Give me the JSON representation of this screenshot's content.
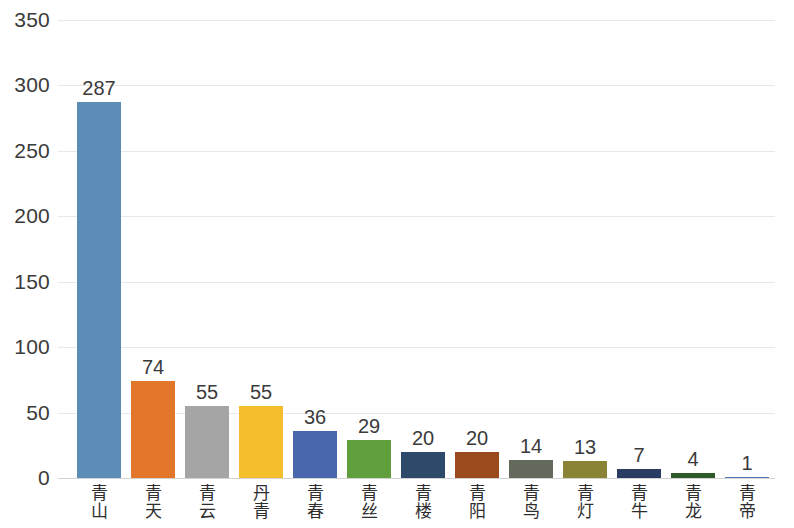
{
  "chart_data": {
    "type": "bar",
    "title": "",
    "subtitle": "",
    "xlabel": "",
    "ylabel": "",
    "ylim": [
      0,
      350
    ],
    "yticks": [
      0,
      50,
      100,
      150,
      200,
      250,
      300,
      350
    ],
    "ytick_labels": [
      "0",
      "50",
      "100",
      "150",
      "200",
      "250",
      "300",
      "350"
    ],
    "grid": true,
    "legend": false,
    "legend_position": "none",
    "orientation": "vertical",
    "data_labels": true,
    "categories": [
      "青山",
      "青天",
      "青云",
      "丹青",
      "青春",
      "青丝",
      "青楼",
      "青阳",
      "青鸟",
      "青灯",
      "青牛",
      "青龙",
      "青帝"
    ],
    "values": [
      287,
      74,
      55,
      55,
      36,
      29,
      20,
      20,
      14,
      13,
      7,
      4,
      1
    ],
    "value_labels": [
      "287",
      "74",
      "55",
      "55",
      "36",
      "29",
      "20",
      "20",
      "14",
      "13",
      "7",
      "4",
      "1"
    ],
    "colors": [
      "#5B8DB8",
      "#E2762B",
      "#A5A5A5",
      "#F4BE2D",
      "#4A67AE",
      "#5FA03C",
      "#2E4A6B",
      "#9B4A1D",
      "#636A5C",
      "#8A8235",
      "#2A3C62",
      "#2D5A28",
      "#4F7CB0"
    ],
    "bar_labels_chars": [
      [
        "青",
        "山"
      ],
      [
        "青",
        "天"
      ],
      [
        "青",
        "云"
      ],
      [
        "丹",
        "青"
      ],
      [
        "青",
        "春"
      ],
      [
        "青",
        "丝"
      ],
      [
        "青",
        "楼"
      ],
      [
        "青",
        "阳"
      ],
      [
        "青",
        "鸟"
      ],
      [
        "青",
        "灯"
      ],
      [
        "青",
        "牛"
      ],
      [
        "青",
        "龙"
      ],
      [
        "青",
        "帝"
      ]
    ]
  },
  "style": {
    "background": "#ffffff",
    "gridline_color": "#e8e8e8",
    "axis_color": "#d3d3d3",
    "tick_text_color": "#3b3b3b",
    "value_text_color": "#3b3b3b",
    "category_text_color": "#2e2e2e"
  }
}
